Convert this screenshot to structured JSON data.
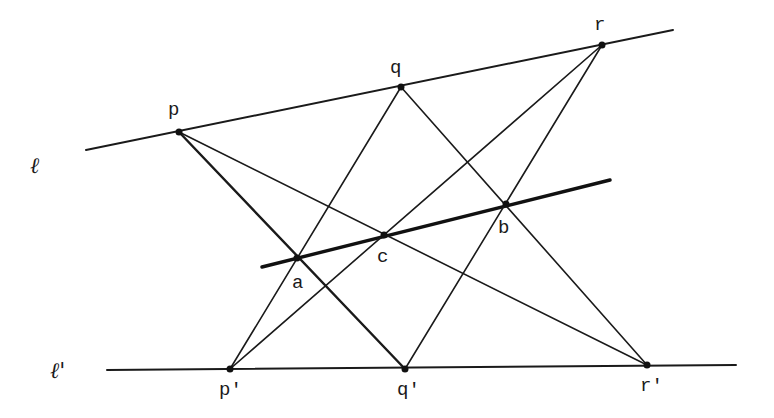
{
  "diagram": {
    "lines": {
      "l": {
        "label": "ℓ",
        "x1": 86,
        "y1": 150,
        "x2": 673,
        "y2": 30,
        "label_x": 30,
        "label_y": 173
      },
      "l_prime": {
        "label": "ℓ'",
        "x1": 107,
        "y1": 370,
        "x2": 736,
        "y2": 365,
        "label_x": 50,
        "label_y": 378
      },
      "pappus_line": {
        "x1": 262,
        "y1": 267,
        "x2": 610,
        "y2": 180
      }
    },
    "points": {
      "p": {
        "label": "p",
        "x": 179,
        "y": 132,
        "label_x": 168,
        "label_y": 115
      },
      "q": {
        "label": "q",
        "x": 401,
        "y": 87,
        "label_x": 390,
        "label_y": 73
      },
      "r": {
        "label": "r",
        "x": 602,
        "y": 45,
        "label_x": 594,
        "label_y": 30
      },
      "p_prime": {
        "label": "p'",
        "x": 230,
        "y": 369,
        "label_x": 219,
        "label_y": 395
      },
      "q_prime": {
        "label": "q'",
        "x": 405,
        "y": 369,
        "label_x": 397,
        "label_y": 395
      },
      "r_prime": {
        "label": "r'",
        "x": 647,
        "y": 365,
        "label_x": 640,
        "label_y": 391
      },
      "a": {
        "label": "a",
        "x": 297,
        "y": 258,
        "label_x": 292,
        "label_y": 288
      },
      "b": {
        "label": "b",
        "x": 506,
        "y": 204,
        "label_x": 498,
        "label_y": 233
      },
      "c": {
        "label": "c",
        "x": 384,
        "y": 235,
        "label_x": 377,
        "label_y": 262
      }
    },
    "segments": [
      {
        "from": "p",
        "to": "q_prime",
        "style": "med"
      },
      {
        "from": "p",
        "to": "r_prime",
        "style": "thin"
      },
      {
        "from": "q",
        "to": "p_prime",
        "style": "thin"
      },
      {
        "from": "q",
        "to": "r_prime",
        "style": "thin"
      },
      {
        "from": "r",
        "to": "p_prime",
        "style": "thin"
      },
      {
        "from": "r",
        "to": "q_prime",
        "style": "thin"
      }
    ]
  }
}
